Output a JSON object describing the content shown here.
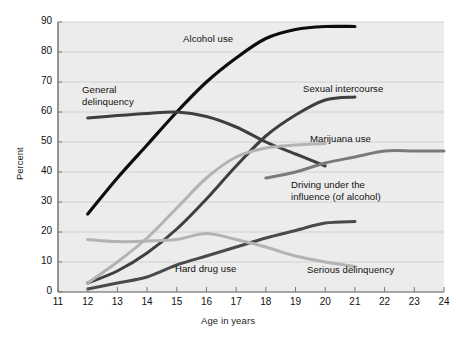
{
  "figure": {
    "background_color": "#ffffff",
    "plot_background_color": "#ececec",
    "grid_color": "#cfcfcf",
    "axis_color": "#555555"
  },
  "axes": {
    "x_title": "Age in years",
    "y_title": "Percent",
    "x_ticks": [
      "11",
      "12",
      "13",
      "14",
      "15",
      "16",
      "17",
      "18",
      "19",
      "20",
      "21",
      "22",
      "23",
      "24"
    ],
    "y_ticks": [
      "0",
      "10",
      "20",
      "30",
      "40",
      "50",
      "60",
      "70",
      "80",
      "90"
    ]
  },
  "labels": {
    "alcohol_use": "Alcohol use",
    "general_delinquency_line1": "General",
    "general_delinquency_line2": "delinquency",
    "sexual_intercourse": "Sexual intercourse",
    "marijuana_use": "Marijuana use",
    "dui_line1": "Driving under the",
    "dui_line2": "influence (of alcohol)",
    "hard_drug_use": "Hard drug use",
    "serious_delinquency": "Serious delinquency"
  },
  "chart_data": {
    "type": "line",
    "title": "",
    "xlabel": "Age in years",
    "ylabel": "Percent",
    "xlim": [
      11,
      24
    ],
    "ylim": [
      0,
      90
    ],
    "grid": true,
    "legend_position": "inline-annotations",
    "x_ticks": [
      11,
      12,
      13,
      14,
      15,
      16,
      17,
      18,
      19,
      20,
      21,
      22,
      23,
      24
    ],
    "y_ticks": [
      0,
      10,
      20,
      30,
      40,
      50,
      60,
      70,
      80,
      90
    ],
    "series": [
      {
        "name": "Alcohol use",
        "color": "#0d0d0d",
        "width": 3.2,
        "x": [
          12,
          13,
          14,
          15,
          16,
          17,
          18,
          19,
          20,
          21
        ],
        "values": [
          26,
          38,
          49,
          60,
          70,
          78,
          84.5,
          87.5,
          88.5,
          88.5
        ]
      },
      {
        "name": "General delinquency",
        "color": "#3f3f3f",
        "width": 3.0,
        "x": [
          12,
          13,
          14,
          15,
          16,
          17,
          18,
          19,
          20
        ],
        "values": [
          58,
          58.8,
          59.5,
          60,
          58.5,
          55,
          50,
          46,
          42
        ]
      },
      {
        "name": "Sexual intercourse",
        "color": "#3f3f3f",
        "width": 3.0,
        "x": [
          12,
          13,
          14,
          15,
          16,
          17,
          18,
          19,
          20,
          21
        ],
        "values": [
          3,
          7,
          13,
          21,
          31,
          42,
          52,
          59,
          64,
          65
        ]
      },
      {
        "name": "Marijuana use",
        "color": "#b3b3b3",
        "width": 3.0,
        "x": [
          12,
          13,
          14,
          15,
          16,
          17,
          18,
          19,
          20
        ],
        "values": [
          3,
          10,
          18,
          28,
          38,
          45,
          48,
          49,
          49.5
        ]
      },
      {
        "name": "Driving under the influence (of alcohol)",
        "color": "#7a7a7a",
        "width": 3.0,
        "x": [
          18,
          19,
          20,
          21,
          22,
          23,
          24
        ],
        "values": [
          38,
          40,
          43,
          45,
          47,
          47,
          47
        ]
      },
      {
        "name": "Hard drug use",
        "color": "#4a4a4a",
        "width": 3.0,
        "x": [
          12,
          13,
          14,
          15,
          16,
          17,
          18,
          19,
          20,
          21
        ],
        "values": [
          1,
          3,
          5,
          9,
          12,
          15,
          18,
          20.5,
          23,
          23.5
        ]
      },
      {
        "name": "Serious delinquency",
        "color": "#b3b3b3",
        "width": 3.0,
        "x": [
          12,
          13,
          14,
          15,
          16,
          17,
          18,
          19,
          20,
          21
        ],
        "values": [
          17.5,
          16.8,
          17,
          17.5,
          19.5,
          17.5,
          15,
          12,
          10,
          8.5
        ]
      }
    ]
  }
}
